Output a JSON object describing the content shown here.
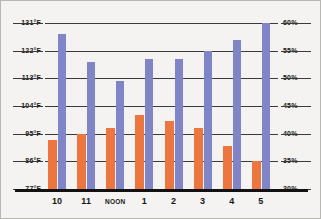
{
  "chart_data": {
    "type": "bar",
    "title": "",
    "xlabel": "",
    "categories": [
      "10",
      "11",
      "NOON",
      "1",
      "2",
      "3",
      "4",
      "5"
    ],
    "grid": true,
    "legend_position": "none",
    "series": [
      {
        "name": "Temperature",
        "unit": "°F",
        "color": "#ec7540",
        "axis": "left",
        "values": [
          93,
          95,
          97,
          101,
          99,
          97,
          91,
          86
        ]
      },
      {
        "name": "Humidity",
        "unit": "%",
        "color": "#8085c8",
        "axis": "right",
        "values": [
          58,
          53,
          49.5,
          53.5,
          53.5,
          55,
          57,
          60
        ]
      }
    ],
    "left_axis": {
      "label": "",
      "ylim": [
        77,
        131
      ],
      "ticks": [
        77,
        86,
        95,
        104,
        113,
        122,
        131
      ],
      "tick_labels": [
        "77°F",
        "86°F",
        "95°F",
        "104°F",
        "113°F",
        "122°F",
        "131°F"
      ]
    },
    "right_axis": {
      "label": "",
      "ylim": [
        30,
        60
      ],
      "ticks": [
        30,
        35,
        40,
        45,
        50,
        55,
        60
      ],
      "tick_labels": [
        "30%",
        "35%",
        "40%",
        "45%",
        "50%",
        "55%",
        "60%"
      ]
    }
  },
  "colors": {
    "temperature_bar": "#ec7540",
    "humidity_bar": "#8085c8",
    "gridline": "#3a3a3a",
    "baseline": "#121212",
    "background": "#f4f3f1",
    "border": "#b9b7b4",
    "text": "#1b1b1b"
  }
}
